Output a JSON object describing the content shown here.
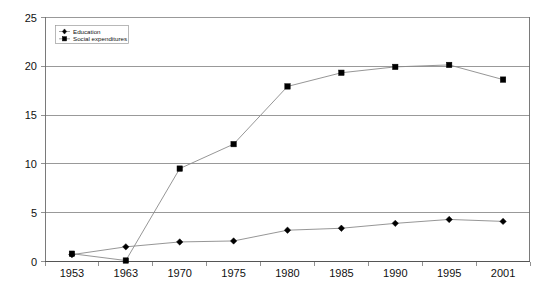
{
  "chart_data": {
    "type": "line",
    "title": "",
    "subtitle": "",
    "xlabel": "",
    "ylabel": "",
    "categories": [
      "1953",
      "1963",
      "1970",
      "1975",
      "1980",
      "1985",
      "1990",
      "1995",
      "2001"
    ],
    "ylim": [
      0,
      25
    ],
    "yticks": [
      "0",
      "5",
      "10",
      "15",
      "20",
      "25"
    ],
    "ytick_values": [
      0,
      5,
      10,
      15,
      20,
      25
    ],
    "grid": "horizontal",
    "legend_position": "top-left",
    "series": [
      {
        "name": "Education",
        "marker": "diamond",
        "values": [
          0.7,
          1.5,
          2.0,
          2.1,
          3.2,
          3.4,
          3.9,
          4.3,
          4.1
        ]
      },
      {
        "name": "Social expenditures",
        "marker": "square",
        "values": [
          0.8,
          0.1,
          9.5,
          12.0,
          17.9,
          19.3,
          19.9,
          20.1,
          18.6
        ]
      }
    ],
    "colors": {
      "line": "#8a8a8a",
      "marker": "#000000",
      "grid": "#808080",
      "frame": "#6b6b6b",
      "background": "#ffffff",
      "text": "#111111"
    }
  },
  "legend": {
    "entries": [
      {
        "label": "Education"
      },
      {
        "label": "Social expenditures"
      }
    ]
  },
  "axes": {
    "y": {
      "labels": [
        "25",
        "20",
        "15",
        "10",
        "5",
        "0"
      ]
    },
    "x": {
      "labels": [
        "1953",
        "1963",
        "1970",
        "1975",
        "1980",
        "1985",
        "1990",
        "1995",
        "2001"
      ]
    }
  }
}
